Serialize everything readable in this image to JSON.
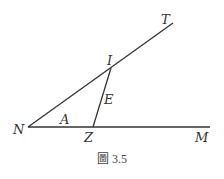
{
  "figure": {
    "caption": "圖 3.5",
    "points": {
      "N": {
        "label": "N",
        "x": 28,
        "y": 127
      },
      "Z": {
        "label": "Z",
        "x": 93,
        "y": 127
      },
      "M": {
        "label": "M",
        "x": 210,
        "y": 127
      },
      "I": {
        "label": "I",
        "x": 111,
        "y": 68
      },
      "T": {
        "label": "T",
        "x": 173,
        "y": 23
      }
    },
    "segment_labels": {
      "A": "A",
      "E": "E"
    },
    "lines": [
      {
        "from": "N",
        "to": "M"
      },
      {
        "from": "N",
        "to": "T"
      },
      {
        "from": "Z",
        "to": "I"
      }
    ],
    "stroke_color": "#333333"
  }
}
